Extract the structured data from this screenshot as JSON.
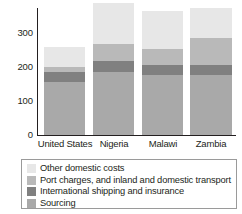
{
  "chart_data": {
    "type": "bar",
    "stacked": true,
    "title": "",
    "xlabel": "",
    "ylabel": "",
    "categories": [
      "United States",
      "Nigeria",
      "Malawi",
      "Zambia"
    ],
    "ylim": [
      0,
      340
    ],
    "yticks": [
      0,
      100,
      200,
      300
    ],
    "ytick_labels": [
      "0",
      "100",
      "200",
      "300"
    ],
    "grid": false,
    "legend_position": "bottom",
    "series": [
      {
        "name": "Sourcing",
        "color": "#a9a9a9",
        "values": [
          141,
          168,
          162,
          162
        ]
      },
      {
        "name": "International shipping and insurance",
        "color": "#808080",
        "values": [
          27,
          29,
          26,
          26
        ]
      },
      {
        "name": "Port charges, and inland and domestic transport",
        "color": "#b9b9b9",
        "values": [
          14,
          47,
          41,
          71
        ]
      },
      {
        "name": "Other domestic costs",
        "color": "#e7e7e7",
        "values": [
          53,
          109,
          103,
          82
        ]
      }
    ],
    "totals": [
      235,
      353,
      332,
      341
    ]
  },
  "legend": {
    "items": [
      {
        "label": "Other domestic costs",
        "color": "#e7e7e7"
      },
      {
        "label": "Port charges, and inland and domestic transport",
        "color": "#b9b9b9"
      },
      {
        "label": "International shipping and insurance",
        "color": "#808080"
      },
      {
        "label": "Sourcing",
        "color": "#a9a9a9"
      }
    ]
  },
  "axis": {
    "y_ticks": [
      "300",
      "200",
      "100",
      "0"
    ],
    "x_labels": [
      "United States",
      "Nigeria",
      "Malawi",
      "Zambia"
    ]
  },
  "colors": {
    "axis": "#231f20",
    "legend_border": "#9a9a9a",
    "background": "#ffffff"
  }
}
